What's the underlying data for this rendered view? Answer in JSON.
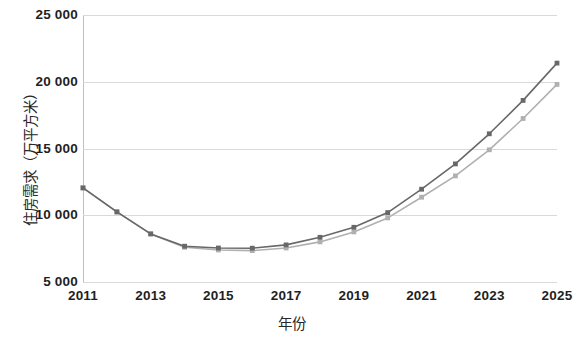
{
  "chart_data": {
    "type": "line",
    "title": "",
    "xlabel": "年份",
    "ylabel": "住房需求（万平方米）",
    "x": [
      2011,
      2012,
      2013,
      2014,
      2015,
      2016,
      2017,
      2018,
      2019,
      2020,
      2021,
      2022,
      2023,
      2024,
      2025
    ],
    "xlim": [
      2011,
      2025
    ],
    "ylim": [
      5000,
      25000
    ],
    "xticks": [
      "2011",
      "2013",
      "2015",
      "2017",
      "2019",
      "2021",
      "2023",
      "2025"
    ],
    "xtick_values": [
      2011,
      2013,
      2015,
      2017,
      2019,
      2021,
      2023,
      2025
    ],
    "yticks": [
      "5 000",
      "10 000",
      "15 000",
      "20 000",
      "25 000"
    ],
    "ytick_values": [
      5000,
      10000,
      15000,
      20000,
      25000
    ],
    "grid": true,
    "legend": "none",
    "marker": "square",
    "series": [
      {
        "name": "series-1",
        "color": "#686868",
        "values": [
          12050,
          10250,
          8600,
          7680,
          7550,
          7530,
          7780,
          8350,
          9100,
          10200,
          11950,
          13850,
          16100,
          18600,
          21400
        ]
      },
      {
        "name": "series-2",
        "color": "#b0b0b0",
        "values": [
          12050,
          10250,
          8600,
          7600,
          7400,
          7350,
          7550,
          8000,
          8750,
          9800,
          11350,
          12950,
          14900,
          17250,
          19800
        ]
      }
    ]
  },
  "axes": {
    "y_title": "住房需求（万平方米）",
    "x_title": "年份"
  },
  "colors": {
    "series_dark": "#686868",
    "series_light": "#b0b0b0",
    "gridline": "#d9d9d9",
    "axis": "#bfbfbf",
    "text": "#1f1f1f",
    "background": "#ffffff"
  }
}
